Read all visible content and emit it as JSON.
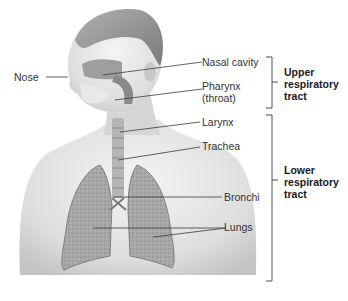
{
  "diagram": {
    "labels": {
      "nose": "Nose",
      "nasal_cavity": "Nasal cavity",
      "pharynx_line1": "Pharynx",
      "pharynx_line2": "(throat)",
      "larynx": "Larynx",
      "trachea": "Trachea",
      "bronchi": "Bronchi",
      "lungs": "Lungs"
    },
    "groups": {
      "upper": {
        "line1": "Upper",
        "line2": "respiratory",
        "line3": "tract",
        "members": [
          "Nose",
          "Nasal cavity",
          "Pharynx (throat)"
        ]
      },
      "lower": {
        "line1": "Lower",
        "line2": "respiratory",
        "line3": "tract",
        "members": [
          "Larynx",
          "Trachea",
          "Bronchi",
          "Lungs"
        ]
      }
    },
    "colors": {
      "line": "#3a3a3a",
      "skin": "#e4e4e4",
      "shade": "#bdbdbd",
      "lung": "#9a9a9a"
    }
  }
}
